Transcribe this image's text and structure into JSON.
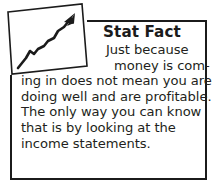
{
  "callout": {
    "kind": "stat-fact-callout",
    "heading": "Stat Fact",
    "body_lines": [
      "Just because",
      "money is com-",
      "ing in does not mean you are",
      "doing well and are profitable.",
      "The only way you can know",
      "that is by looking at the",
      "income statements."
    ],
    "body_text": "Just because money is coming in does not mean you are doing well and are profitable. The only way you can know that is by looking at the income statements.",
    "icon": {
      "name": "upward-trend-arrow-icon",
      "description": "tilted square frame containing a rising zigzag arrow"
    },
    "colors": {
      "border": "#1b1b1b",
      "text": "#231f20",
      "background": "#ffffff"
    }
  }
}
